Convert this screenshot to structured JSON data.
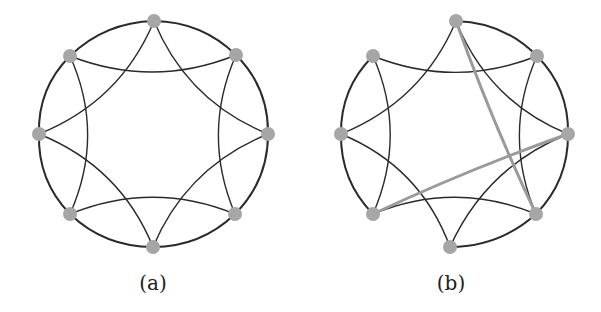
{
  "style": {
    "edge_color": "#2a2a2a",
    "rewired_edge_color": "#9a9a9a",
    "node_color": "#a6a6a6",
    "node_radius": 7,
    "edge_width": 1.4,
    "ring_width": 2,
    "rewired_width": 3
  },
  "graphs": [
    {
      "id": "a",
      "label": "(a)",
      "label_pos": [
        153,
        290
      ],
      "center": [
        154,
        134
      ],
      "nodes": [
        {
          "name": "top",
          "pos": [
            154,
            21
          ]
        },
        {
          "name": "top-right",
          "pos": [
            236,
            55
          ]
        },
        {
          "name": "right",
          "pos": [
            268,
            134
          ]
        },
        {
          "name": "bottom-right",
          "pos": [
            235,
            214
          ]
        },
        {
          "name": "bottom",
          "pos": [
            153,
            247
          ]
        },
        {
          "name": "bottom-left",
          "pos": [
            70,
            214
          ]
        },
        {
          "name": "left",
          "pos": [
            39,
            134
          ]
        },
        {
          "name": "top-left",
          "pos": [
            70,
            56
          ]
        }
      ],
      "ring_edges": [
        [
          0,
          1
        ],
        [
          1,
          2
        ],
        [
          2,
          3
        ],
        [
          3,
          4
        ],
        [
          4,
          5
        ],
        [
          5,
          6
        ],
        [
          6,
          7
        ],
        [
          7,
          0
        ]
      ],
      "chord_edges": [
        [
          0,
          2
        ],
        [
          1,
          3
        ],
        [
          2,
          4
        ],
        [
          3,
          5
        ],
        [
          4,
          6
        ],
        [
          5,
          7
        ],
        [
          6,
          0
        ],
        [
          7,
          1
        ]
      ],
      "rewired_edges": []
    },
    {
      "id": "b",
      "label": "(b)",
      "label_pos": [
        451,
        290
      ],
      "center": [
        455,
        134
      ],
      "nodes": [
        {
          "name": "top",
          "pos": [
            456,
            21
          ]
        },
        {
          "name": "top-right",
          "pos": [
            537,
            56
          ]
        },
        {
          "name": "right",
          "pos": [
            568,
            134
          ]
        },
        {
          "name": "bottom-right",
          "pos": [
            536,
            214
          ]
        },
        {
          "name": "bottom",
          "pos": [
            450,
            247
          ]
        },
        {
          "name": "bottom-left",
          "pos": [
            373,
            214
          ]
        },
        {
          "name": "left",
          "pos": [
            341,
            134
          ]
        },
        {
          "name": "top-left",
          "pos": [
            373,
            56
          ]
        }
      ],
      "ring_edges": [
        [
          0,
          1
        ],
        [
          1,
          2
        ],
        [
          2,
          3
        ],
        [
          3,
          4
        ],
        [
          5,
          6
        ],
        [
          6,
          7
        ]
      ],
      "chord_edges": [
        [
          0,
          2
        ],
        [
          1,
          3
        ],
        [
          2,
          4
        ],
        [
          3,
          5
        ],
        [
          4,
          6
        ],
        [
          5,
          7
        ],
        [
          6,
          0
        ],
        [
          7,
          1
        ]
      ],
      "rewired_edges": [
        [
          0,
          3
        ],
        [
          2,
          5
        ]
      ]
    }
  ]
}
